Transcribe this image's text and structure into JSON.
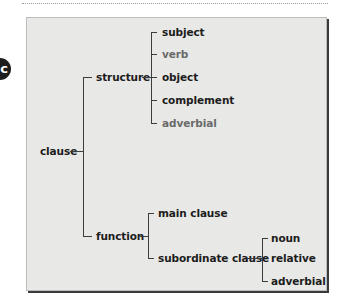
{
  "badge": {
    "label": "c"
  },
  "tree": {
    "root": "clause",
    "structure": {
      "label": "structure",
      "children": [
        {
          "label": "subject",
          "style": "bold"
        },
        {
          "label": "verb",
          "style": "light"
        },
        {
          "label": "object",
          "style": "bold"
        },
        {
          "label": "complement",
          "style": "bold"
        },
        {
          "label": "adverbial",
          "style": "light"
        }
      ]
    },
    "function": {
      "label": "function",
      "main": "main clause",
      "subordinate": {
        "label": "subordinate clause",
        "children": [
          "noun",
          "relative",
          "adverbial"
        ]
      }
    }
  },
  "colors": {
    "box_bg": "#e8e8e6",
    "text": "#1c1c1c",
    "light_text": "#6a6a6a",
    "badge": "#1e1e1e"
  }
}
